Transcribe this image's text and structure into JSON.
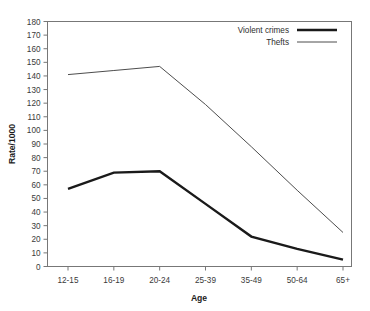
{
  "chart_data": {
    "type": "line",
    "title": "",
    "xlabel": "Age",
    "ylabel": "Rate/1000",
    "categories": [
      "12-15",
      "16-19",
      "20-24",
      "25-39",
      "35-49",
      "50-64",
      "65+"
    ],
    "ylim": [
      0,
      180
    ],
    "ytick_step": 10,
    "yticks": [
      "0",
      "10",
      "20",
      "30",
      "40",
      "50",
      "60",
      "70",
      "80",
      "90",
      "100",
      "110",
      "120",
      "130",
      "140",
      "150",
      "160",
      "170",
      "180"
    ],
    "grid": false,
    "legend_position": "top-right",
    "series": [
      {
        "name": "Violent crimes",
        "values": [
          57,
          69,
          70,
          46,
          22,
          13,
          5
        ],
        "color": "#1a1a1a",
        "line_width": 2.4
      },
      {
        "name": "Thefts",
        "values": [
          141,
          144,
          147,
          119,
          88,
          56,
          25
        ],
        "color": "#4d4d4d",
        "line_width": 1.0
      }
    ]
  },
  "axis": {
    "x_title": "Age",
    "y_title": "Rate/1000"
  },
  "legend": {
    "items": [
      {
        "label": "Violent crimes",
        "style": "thick"
      },
      {
        "label": "Thefts",
        "style": "thin"
      }
    ]
  }
}
